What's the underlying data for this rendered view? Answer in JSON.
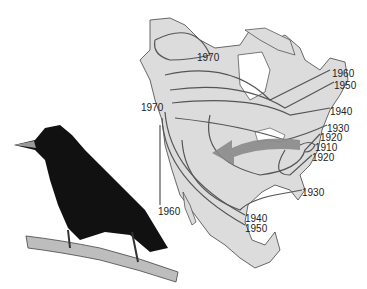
{
  "map": {
    "title": "Spread of the European starling across North America",
    "colors": {
      "land": "#dcdcdc",
      "coast": "#444444",
      "isoline": "#555555",
      "arrow": "#8a8a8a",
      "water": "#ffffff"
    },
    "isochrone_labels": [
      {
        "year": "1970",
        "x": 197,
        "y": 53
      },
      {
        "year": "1960",
        "x": 332,
        "y": 69
      },
      {
        "year": "1950",
        "x": 334,
        "y": 81
      },
      {
        "year": "1970",
        "x": 141,
        "y": 103
      },
      {
        "year": "1940",
        "x": 330,
        "y": 107
      },
      {
        "year": "1930",
        "x": 327,
        "y": 124
      },
      {
        "year": "1920",
        "x": 320,
        "y": 133
      },
      {
        "year": "1910",
        "x": 315,
        "y": 143
      },
      {
        "year": "1920",
        "x": 312,
        "y": 153
      },
      {
        "year": "1930",
        "x": 302,
        "y": 188
      },
      {
        "year": "1960",
        "x": 158,
        "y": 207
      },
      {
        "year": "1940",
        "x": 245,
        "y": 214
      },
      {
        "year": "1950",
        "x": 245,
        "y": 224
      }
    ],
    "arrow": {
      "direction": "west",
      "meaning": "direction of spread"
    }
  },
  "bird": {
    "name": "European starling",
    "perch": "branch"
  }
}
